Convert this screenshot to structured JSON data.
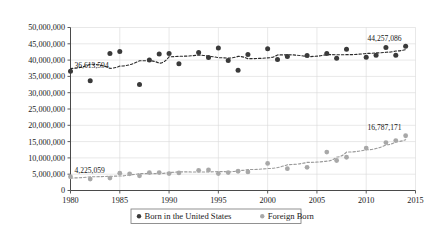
{
  "chart_data": {
    "type": "scatter",
    "title": "",
    "subtitle": "",
    "xlabel": "",
    "ylabel": "",
    "xlim": [
      1980,
      2015
    ],
    "ylim": [
      0,
      50000000
    ],
    "grid": true,
    "legend_position": "bottom",
    "xticks": [
      "1980",
      "1985",
      "1990",
      "1995",
      "2000",
      "2005",
      "2010",
      "2015"
    ],
    "xtick_values": [
      1980,
      1985,
      1990,
      1995,
      2000,
      2005,
      2010,
      2015
    ],
    "yticks": [
      "0",
      "5,000,000",
      "10,000,000",
      "15,000,000",
      "20,000,000",
      "25,000,000",
      "30,000,000",
      "35,000,000",
      "40,000,000",
      "45,000,000",
      "50,000,000"
    ],
    "ytick_values": [
      0,
      5000000,
      10000000,
      15000000,
      20000000,
      25000000,
      30000000,
      35000000,
      40000000,
      45000000,
      50000000
    ],
    "series": [
      {
        "name": "Born in the United States",
        "marker": "circle",
        "color": "#3a3a3a",
        "trendline": true,
        "trendline_style": "dotted",
        "x": [
          1980,
          1982,
          1984,
          1985,
          1987,
          1988,
          1989,
          1990,
          1991,
          1993,
          1994,
          1995,
          1996,
          1997,
          1998,
          2000,
          2001,
          2002,
          2004,
          2006,
          2007,
          2008,
          2010,
          2011,
          2012,
          2013,
          2014
        ],
        "values": [
          36613594,
          33700000,
          42000000,
          42600000,
          32500000,
          40000000,
          41900000,
          42000000,
          38900000,
          42300000,
          40800000,
          43700000,
          39900000,
          36900000,
          41700000,
          43500000,
          40200000,
          41100000,
          41400000,
          42000000,
          40600000,
          43300000,
          40900000,
          41500000,
          43900000,
          41500000,
          44257086
        ]
      },
      {
        "name": "Foreign Born",
        "marker": "circle",
        "color": "#a8a8a8",
        "trendline": true,
        "trendline_style": "dotted",
        "x": [
          1980,
          1982,
          1984,
          1985,
          1986,
          1987,
          1988,
          1989,
          1990,
          1991,
          1993,
          1994,
          1995,
          1996,
          1997,
          1998,
          2000,
          2002,
          2004,
          2006,
          2007,
          2008,
          2010,
          2012,
          2013,
          2014
        ],
        "values": [
          4225059,
          3500000,
          3800000,
          5300000,
          5100000,
          4500000,
          5500000,
          5500000,
          5200000,
          5400000,
          6200000,
          6300000,
          5200000,
          5500000,
          5900000,
          5700000,
          8300000,
          6700000,
          7100000,
          11800000,
          9200000,
          10200000,
          13000000,
          14700000,
          15300000,
          16787171
        ]
      }
    ],
    "annotations": [
      {
        "text": "36,613,594",
        "series": "Born in the United States",
        "x": 1980,
        "y": 36613594
      },
      {
        "text": "44,257,086",
        "series": "Born in the United States",
        "x": 2014,
        "y": 44257086
      },
      {
        "text": "4,225,059",
        "series": "Foreign Born",
        "x": 1980,
        "y": 4225059
      },
      {
        "text": "16,787,171",
        "series": "Foreign Born",
        "x": 2014,
        "y": 16787171
      }
    ]
  },
  "legend": {
    "items": [
      {
        "label": "Born in the United States",
        "color": "#3a3a3a"
      },
      {
        "label": "Foreign Born",
        "color": "#a8a8a8"
      }
    ]
  }
}
